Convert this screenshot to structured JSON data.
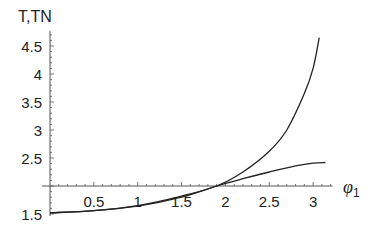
{
  "chart_data": {
    "type": "line",
    "title": "",
    "ylabel": "T,TN",
    "xlabel": "φ",
    "xlabel_subscript": "1",
    "xlim": [
      0,
      3.2
    ],
    "ylim": [
      1.5,
      4.7
    ],
    "x_axis_crosses_y_at": 2,
    "grid": false,
    "legend": null,
    "x_ticks": [
      0.5,
      1,
      1.5,
      2,
      2.5,
      3
    ],
    "x_tick_labels": [
      "0.5",
      "1",
      "1.5",
      "2",
      "2.5",
      "3"
    ],
    "y_ticks": [
      1.5,
      2.5,
      3,
      3.5,
      4,
      4.5
    ],
    "y_tick_labels": [
      "1.5",
      "2.5",
      "3",
      "3.5",
      "4",
      "4.5"
    ],
    "series": [
      {
        "name": "T",
        "x": [
          0,
          0.5,
          1.0,
          1.5,
          1.9,
          2.2,
          2.5,
          2.7,
          2.9,
          3.0,
          3.07
        ],
        "values": [
          1.52,
          1.56,
          1.65,
          1.82,
          2.0,
          2.25,
          2.62,
          3.0,
          3.65,
          4.1,
          4.65
        ]
      },
      {
        "name": "TN",
        "x": [
          0,
          0.5,
          1.0,
          1.5,
          1.9,
          2.2,
          2.5,
          2.8,
          3.0,
          3.14
        ],
        "values": [
          1.52,
          1.56,
          1.64,
          1.8,
          2.0,
          2.13,
          2.25,
          2.36,
          2.41,
          2.42
        ]
      }
    ]
  },
  "layout": {
    "origin_px_x": 50,
    "px_per_x_unit": 87.7,
    "y2_px": 186,
    "px_per_y_unit": 56,
    "axis_color": "#555555",
    "curve_color": "#222222"
  }
}
